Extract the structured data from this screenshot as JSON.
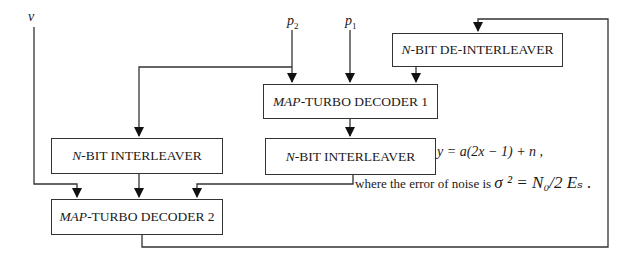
{
  "diagram": {
    "inputs": {
      "v": {
        "label": "v"
      },
      "p2": {
        "label": "p",
        "sub": "2"
      },
      "p1": {
        "label": "p",
        "sub": "1"
      }
    },
    "blocks": {
      "deinterleaver": {
        "prefix": "N",
        "label": "-BIT DE-INTERLEAVER"
      },
      "decoder1": {
        "prefix": "MAP",
        "label": "-TURBO DECODER 1"
      },
      "interleaver_right": {
        "prefix": "N",
        "label": "-BIT INTERLEAVER"
      },
      "interleaver_left": {
        "prefix": "N",
        "label": "-BIT INTERLEAVER"
      },
      "decoder2": {
        "prefix": "MAP",
        "label": "-TURBO DECODER 2"
      }
    },
    "annotations": {
      "equation1": "y = a(2x − 1) + n ,",
      "equation2_text": "where the error of noise is",
      "equation2_math": "σ ² = N₀/2 Eₛ ."
    },
    "connections": [
      {
        "from": "v",
        "to": "decoder2"
      },
      {
        "from": "p2",
        "to": "decoder1"
      },
      {
        "from": "p2",
        "to": "interleaver_left"
      },
      {
        "from": "p1",
        "to": "decoder1"
      },
      {
        "from": "deinterleaver",
        "to": "decoder1"
      },
      {
        "from": "decoder1",
        "to": "interleaver_right"
      },
      {
        "from": "interleaver_left",
        "to": "decoder2"
      },
      {
        "from": "interleaver_right",
        "to": "decoder2"
      },
      {
        "from": "decoder2",
        "to": "deinterleaver"
      }
    ]
  }
}
